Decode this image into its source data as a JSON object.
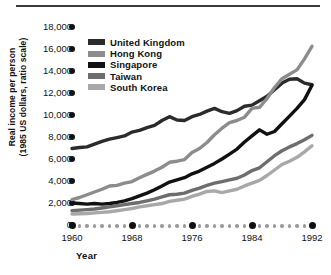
{
  "chart_data": {
    "type": "line",
    "title": "",
    "xlabel": "Year",
    "ylabel": "Real income per person\n(1985 US dollars, ratio scale)",
    "x": [
      1960,
      1961,
      1962,
      1963,
      1964,
      1965,
      1966,
      1967,
      1968,
      1969,
      1970,
      1971,
      1972,
      1973,
      1974,
      1975,
      1976,
      1977,
      1978,
      1979,
      1980,
      1981,
      1982,
      1983,
      1984,
      1985,
      1986,
      1987,
      1988,
      1989,
      1990,
      1991,
      1992
    ],
    "xlim": [
      1960,
      1992
    ],
    "ylim": [
      0,
      18000
    ],
    "xticks": [
      "1960",
      "1968",
      "1976",
      "1984",
      "1992"
    ],
    "yticks": [
      "0",
      "2,000",
      "4,000",
      "6,000",
      "8,000",
      "10,000",
      "12,000",
      "14,000",
      "16,000",
      "18,000"
    ],
    "ytick_values": [
      0,
      2000,
      4000,
      6000,
      8000,
      10000,
      12000,
      14000,
      16000,
      18000
    ],
    "grid": false,
    "legend_position": "upper-left-inside",
    "series": [
      {
        "name": "United Kingdom",
        "color": "#2b2b2b",
        "values": [
          6950,
          7050,
          7100,
          7350,
          7600,
          7800,
          7950,
          8100,
          8450,
          8600,
          8850,
          9050,
          9500,
          9850,
          9550,
          9500,
          9850,
          10050,
          10350,
          10600,
          10300,
          10150,
          10400,
          10800,
          10900,
          11300,
          11700,
          12300,
          12900,
          13250,
          13300,
          12900,
          12750
        ]
      },
      {
        "name": "Hong Kong",
        "color": "#8c8c8c",
        "values": [
          2300,
          2500,
          2750,
          3000,
          3250,
          3550,
          3600,
          3800,
          3950,
          4300,
          4600,
          4900,
          5250,
          5700,
          5800,
          5950,
          6600,
          6950,
          7500,
          8200,
          8800,
          9300,
          9500,
          9800,
          10600,
          10700,
          11500,
          12500,
          13300,
          13700,
          14100,
          15100,
          16250
        ]
      },
      {
        "name": "Singapore",
        "color": "#111111",
        "values": [
          2000,
          1950,
          1900,
          1950,
          1900,
          1950,
          2050,
          2200,
          2400,
          2650,
          2900,
          3200,
          3550,
          3900,
          4100,
          4300,
          4650,
          4900,
          5250,
          5600,
          6000,
          6450,
          6900,
          7550,
          8100,
          8650,
          8250,
          8500,
          9200,
          9900,
          10600,
          11400,
          12700
        ]
      },
      {
        "name": "Taiwan",
        "color": "#6d6d6d",
        "values": [
          1300,
          1350,
          1400,
          1450,
          1550,
          1650,
          1750,
          1850,
          1950,
          2050,
          2200,
          2350,
          2550,
          2750,
          2800,
          2900,
          3150,
          3350,
          3600,
          3800,
          3950,
          4100,
          4250,
          4550,
          4950,
          5200,
          5750,
          6300,
          6750,
          7100,
          7400,
          7750,
          8150
        ]
      },
      {
        "name": "South Korea",
        "color": "#a8a8a8",
        "values": [
          1000,
          1020,
          1050,
          1100,
          1150,
          1200,
          1300,
          1400,
          1500,
          1650,
          1750,
          1850,
          1950,
          2150,
          2250,
          2350,
          2600,
          2800,
          3050,
          3100,
          2950,
          3100,
          3250,
          3550,
          3800,
          4050,
          4500,
          5000,
          5500,
          5800,
          6150,
          6650,
          7200
        ]
      }
    ]
  },
  "axis": {
    "y_label": "Real income per person\n(1985 US dollars, ratio scale)",
    "x_label": "Year"
  },
  "legend": {
    "items": [
      {
        "label": "United Kingdom",
        "color": "#2b2b2b"
      },
      {
        "label": "Hong Kong",
        "color": "#8c8c8c"
      },
      {
        "label": "Singapore",
        "color": "#111111"
      },
      {
        "label": "Taiwan",
        "color": "#6d6d6d"
      },
      {
        "label": "South Korea",
        "color": "#a8a8a8"
      }
    ]
  }
}
